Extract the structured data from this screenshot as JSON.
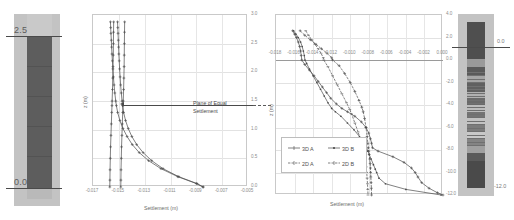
{
  "figure": {
    "kind": "settlement-depth-profiles",
    "colors": {
      "soil_dark": "#5d5d5d",
      "soil_light": "#c3c3c3",
      "curve": "#4a4a4a",
      "grid": "#e2e2e2",
      "axis": "#9a9a9a"
    }
  },
  "left_column": {
    "name": "left-soil-column",
    "top_label": "2.5",
    "bottom_label": "0.0"
  },
  "right_column": {
    "name": "right-soil-column",
    "top_label": "0.0",
    "bottom_label": "-12.0"
  },
  "chart_data": [
    {
      "type": "line",
      "name": "left-settlement-plot",
      "title": "",
      "xlabel": "Settlement (m)",
      "ylabel": "z (m)",
      "xlim": [
        -0.017,
        -0.005
      ],
      "ylim": [
        0.0,
        3.0
      ],
      "xticks": [
        "-0.017",
        "-0.015",
        "-0.013",
        "-0.011",
        "-0.009",
        "-0.007",
        "-0.005"
      ],
      "xtick_values": [
        -0.017,
        -0.015,
        -0.013,
        -0.011,
        -0.009,
        -0.007,
        -0.005
      ],
      "yticks": [
        "3.0",
        "2.5",
        "2.0",
        "1.5",
        "1.0",
        "0.5",
        "0.0"
      ],
      "ytick_values": [
        3.0,
        2.5,
        2.0,
        1.5,
        1.0,
        0.5,
        0.0
      ],
      "y_axis_position": "right",
      "grid": true,
      "annotation": {
        "text_line1": "Plane of Equal",
        "text_line2": "Settlement",
        "arrow": "left",
        "at_y": 1.42
      },
      "series": [
        {
          "name": "A",
          "y": [
            2.88,
            2.78,
            2.68,
            2.56,
            2.44,
            2.32,
            2.2,
            2.06,
            1.92,
            1.78,
            1.64,
            1.5,
            1.42,
            1.3,
            1.16,
            1.02,
            0.88,
            0.74,
            0.6,
            0.46,
            0.32,
            0.18,
            0.06,
            0.0
          ],
          "values": [
            -0.01565,
            -0.01563,
            -0.01561,
            -0.01558,
            -0.01556,
            -0.01553,
            -0.0155,
            -0.01546,
            -0.01542,
            -0.01537,
            -0.01531,
            -0.01524,
            -0.01519,
            -0.01509,
            -0.01492,
            -0.01468,
            -0.01436,
            -0.01396,
            -0.01342,
            -0.0127,
            -0.01174,
            -0.01044,
            -0.009,
            -0.0085
          ]
        },
        {
          "name": "B",
          "y": [
            2.88,
            2.78,
            2.68,
            2.56,
            2.44,
            2.32,
            2.2,
            2.06,
            1.92,
            1.78,
            1.64,
            1.5,
            1.42,
            1.3,
            1.16,
            1.02,
            0.88,
            0.74,
            0.6,
            0.46,
            0.32,
            0.18,
            0.06,
            0.0
          ],
          "values": [
            -0.0151,
            -0.01508,
            -0.01506,
            -0.01504,
            -0.01502,
            -0.015,
            -0.01497,
            -0.01494,
            -0.0149,
            -0.01486,
            -0.01481,
            -0.01475,
            -0.01471,
            -0.01463,
            -0.01448,
            -0.01427,
            -0.01399,
            -0.01362,
            -0.01312,
            -0.01246,
            -0.01158,
            -0.01036,
            -0.00895,
            -0.00845
          ]
        },
        {
          "name": "C",
          "y": [
            2.88,
            2.7,
            2.5,
            2.3,
            2.1,
            1.9,
            1.7,
            1.5,
            1.42,
            1.3,
            1.1,
            0.9,
            0.7,
            0.5,
            0.3,
            0.12,
            0.0
          ],
          "values": [
            -0.01455,
            -0.01456,
            -0.01457,
            -0.01458,
            -0.01459,
            -0.01461,
            -0.01463,
            -0.01466,
            -0.01468,
            -0.0147,
            -0.01473,
            -0.01476,
            -0.01479,
            -0.01481,
            -0.01483,
            -0.01484,
            -0.01485
          ]
        },
        {
          "name": "D",
          "y": [
            2.88,
            2.7,
            2.5,
            2.3,
            2.1,
            1.9,
            1.7,
            1.5,
            1.42,
            1.3,
            1.1,
            0.9,
            0.7,
            0.5,
            0.3,
            0.12,
            0.0
          ],
          "values": [
            -0.0154,
            -0.01541,
            -0.01542,
            -0.01543,
            -0.01545,
            -0.01547,
            -0.01549,
            -0.01552,
            -0.01553,
            -0.01555,
            -0.01558,
            -0.01561,
            -0.01564,
            -0.01566,
            -0.01568,
            -0.01569,
            -0.0157
          ]
        }
      ]
    },
    {
      "type": "line",
      "name": "right-settlement-plot",
      "title": "",
      "xlabel": "Settlement (m)",
      "ylabel": "z (m)",
      "xlim": [
        -0.018,
        0.0
      ],
      "ylim": [
        -12.0,
        4.0
      ],
      "xticks": [
        "-0.018",
        "-0.016",
        "-0.014",
        "-0.012",
        "-0.010",
        "-0.008",
        "-0.006",
        "-0.004",
        "-0.002",
        "0.000"
      ],
      "xtick_values": [
        -0.018,
        -0.016,
        -0.014,
        -0.012,
        -0.01,
        -0.008,
        -0.006,
        -0.004,
        -0.002,
        0.0
      ],
      "yticks": [
        "4.0",
        "2.0",
        "0.0",
        "-2.0",
        "-4.0",
        "-6.0",
        "-8.0",
        "-10.0",
        "-12.0"
      ],
      "ytick_values": [
        4.0,
        2.0,
        0.0,
        -2.0,
        -4.0,
        -6.0,
        -8.0,
        -10.0,
        -12.0
      ],
      "x_axis_position": "top",
      "y_axis_position": "right",
      "grid": true,
      "legend": {
        "position": "lower-left",
        "entries": [
          "3D A",
          "3D B",
          "2D A",
          "2D B"
        ]
      },
      "series": [
        {
          "name": "3D A",
          "marker": "cross",
          "y": [
            2.6,
            2.3,
            2.0,
            1.6,
            1.2,
            0.8,
            0.4,
            0.0,
            -0.4,
            -0.9,
            -1.4,
            -1.9,
            -2.4,
            -2.9,
            -3.4,
            -3.9,
            -4.3,
            -4.6,
            -5.0,
            -5.5,
            -6.0,
            -6.5,
            -7.0,
            -7.4,
            -7.8,
            -8.1,
            -8.6,
            -9.1,
            -9.6,
            -10.0,
            -10.4,
            -10.9,
            -11.4,
            -11.8,
            -12.0
          ],
          "values": [
            -0.0162,
            -0.016,
            -0.0158,
            -0.0156,
            -0.01545,
            -0.01535,
            -0.01528,
            -0.01522,
            -0.0149,
            -0.0144,
            -0.0139,
            -0.01345,
            -0.013,
            -0.01255,
            -0.0121,
            -0.0115,
            -0.0109,
            -0.0103,
            -0.0095,
            -0.0088,
            -0.0083,
            -0.008,
            -0.00782,
            -0.0077,
            -0.0076,
            -0.007,
            -0.0054,
            -0.0042,
            -0.0034,
            -0.003,
            -0.0027,
            -0.0023,
            -0.0015,
            -0.0006,
            0.0
          ]
        },
        {
          "name": "3D B",
          "marker": "dot",
          "y": [
            2.6,
            2.3,
            2.0,
            1.6,
            1.2,
            0.8,
            0.4,
            0.0,
            -0.3,
            -0.8,
            -1.4,
            -2.0,
            -2.6,
            -3.2,
            -3.8,
            -4.3,
            -4.6,
            -5.0,
            -5.6,
            -6.2,
            -6.8,
            -7.3,
            -7.8,
            -8.1,
            -8.4,
            -8.8,
            -9.3,
            -9.7,
            -10.0,
            -10.5,
            -11.0,
            -11.5,
            -12.0
          ],
          "values": [
            -0.0161,
            -0.01585,
            -0.0156,
            -0.01535,
            -0.01518,
            -0.01505,
            -0.01495,
            -0.01488,
            -0.0147,
            -0.0144,
            -0.014,
            -0.0136,
            -0.0132,
            -0.0128,
            -0.0124,
            -0.012,
            -0.0116,
            -0.011,
            -0.0103,
            -0.0096,
            -0.009,
            -0.00855,
            -0.00825,
            -0.0081,
            -0.00795,
            -0.00775,
            -0.0075,
            -0.0073,
            -0.00715,
            -0.0069,
            -0.0062,
            -0.004,
            -0.0002
          ]
        },
        {
          "name": "2D A",
          "marker": "plus",
          "y": [
            2.6,
            2.2,
            1.8,
            1.4,
            1.0,
            0.6,
            0.2,
            0.0,
            -0.5,
            -1.2,
            -2.0,
            -2.8,
            -3.6,
            -4.2,
            -4.6,
            -5.2,
            -6.0,
            -6.8,
            -7.4,
            -7.8,
            -8.1,
            -8.4,
            -8.8,
            -9.2,
            -9.6,
            -10.0,
            -10.4,
            -10.9,
            -11.4,
            -12.0
          ],
          "values": [
            -0.0154,
            -0.0149,
            -0.0143,
            -0.0137,
            -0.0131,
            -0.0125,
            -0.012,
            -0.0119,
            -0.0112,
            -0.0106,
            -0.01,
            -0.0095,
            -0.00905,
            -0.00875,
            -0.0086,
            -0.00845,
            -0.0083,
            -0.00818,
            -0.0081,
            -0.00805,
            -0.008,
            -0.00795,
            -0.0079,
            -0.00785,
            -0.00782,
            -0.0078,
            -0.00778,
            -0.00775,
            -0.00772,
            -0.0077
          ]
        },
        {
          "name": "2D B",
          "marker": "dash",
          "y": [
            2.6,
            2.2,
            1.8,
            1.4,
            1.0,
            0.6,
            0.2,
            0.0,
            -0.6,
            -1.4,
            -2.2,
            -3.0,
            -3.8,
            -4.4,
            -4.8,
            -5.6,
            -6.4,
            -7.2,
            -7.8,
            -8.1,
            -8.5,
            -9.0,
            -9.5,
            -10.0,
            -10.5,
            -11.0,
            -11.5,
            -12.0
          ],
          "values": [
            -0.0148,
            -0.0145,
            -0.01415,
            -0.0138,
            -0.01345,
            -0.01315,
            -0.0129,
            -0.01285,
            -0.0124,
            -0.0119,
            -0.0114,
            -0.0109,
            -0.0104,
            -0.01005,
            -0.00985,
            -0.0095,
            -0.00915,
            -0.00885,
            -0.00865,
            -0.00855,
            -0.00845,
            -0.00835,
            -0.00828,
            -0.00822,
            -0.00818,
            -0.00814,
            -0.00811,
            -0.00808
          ]
        }
      ]
    }
  ]
}
